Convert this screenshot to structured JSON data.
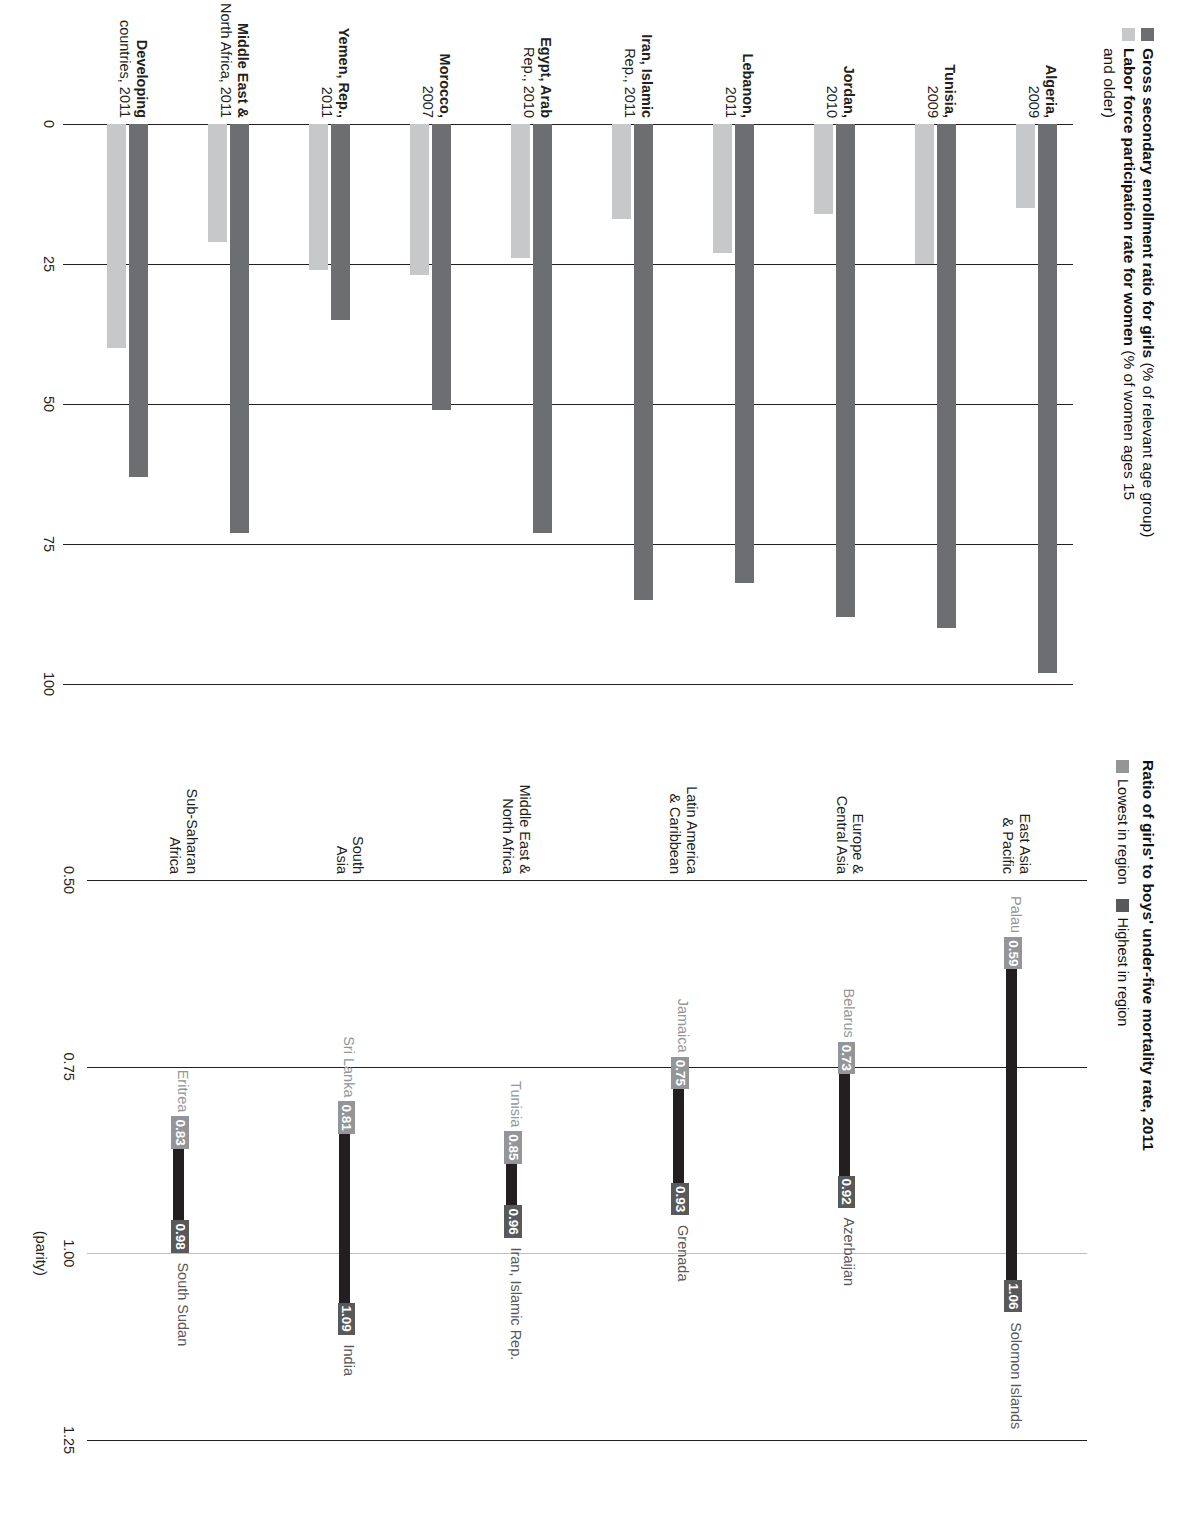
{
  "charts": {
    "enrollment": {
      "title_bold_1": "Gross secondary enrollment ratio for girls",
      "title_reg_1": " (% of relevant age group)",
      "title_bold_2": "Labor force participation rate for women",
      "title_reg_2": " (% of women ages 15",
      "title_reg_2b": "and older)",
      "legend": [
        {
          "label": "Gross secondary enrollment ratio for girls",
          "color": "#6d6e71"
        },
        {
          "label": "Labor force participation rate for women",
          "color": "#c7c8ca"
        }
      ],
      "yticks": [
        "100",
        "75",
        "50",
        "25",
        "0"
      ],
      "categories": [
        {
          "name": "Algeria,",
          "year": "2009"
        },
        {
          "name": "Tunisia,",
          "year": "2009"
        },
        {
          "name": "Jordan,",
          "year": "2010"
        },
        {
          "name": "Lebanon,",
          "year": "2011"
        },
        {
          "name": "Iran, Islamic",
          "year": "Rep., 2011"
        },
        {
          "name": "Egypt, Arab",
          "year": "Rep., 2010"
        },
        {
          "name": "Morocco,",
          "year": "2007"
        },
        {
          "name": "Yemen, Rep.,",
          "year": "2011"
        },
        {
          "name": "Middle East &",
          "year": "North Africa, 2011"
        },
        {
          "name": "Developing",
          "year": "countries, 2011"
        }
      ],
      "series": [
        {
          "name": "Gross secondary enrollment ratio for girls",
          "values": [
            98,
            90,
            88,
            82,
            85,
            73,
            51,
            35,
            73,
            63
          ]
        },
        {
          "name": "Labor force participation rate for women",
          "values": [
            15,
            25,
            16,
            23,
            17,
            24,
            27,
            26,
            21,
            40
          ]
        }
      ]
    },
    "mortality": {
      "title": "Ratio of girls' to boys' under-five mortality rate, 2011",
      "legend": [
        {
          "label": "Lowest in region",
          "color": "#939598"
        },
        {
          "label": "Highest in region",
          "color": "#58595b"
        }
      ],
      "xticks": [
        "0.50",
        "0.75",
        "1.00",
        "1.25"
      ],
      "parity_label": "(parity)",
      "rows": [
        {
          "region": "East Asia\n& Pacific",
          "low_country": "Palau",
          "low": "0.59",
          "high_country": "Solomon Islands",
          "high": "1.06"
        },
        {
          "region": "Europe &\nCentral Asia",
          "low_country": "Belarus",
          "low": "0.73",
          "high_country": "Azerbaijan",
          "high": "0.92"
        },
        {
          "region": "Latin America\n& Caribbean",
          "low_country": "Jamaica",
          "low": "0.75",
          "high_country": "Grenada",
          "high": "0.93"
        },
        {
          "region": "Middle East &\nNorth Africa",
          "low_country": "Tunisia",
          "low": "0.85",
          "high_country": "Iran, Islamic Rep.",
          "high": "0.96"
        },
        {
          "region": "South\nAsia",
          "low_country": "Sri Lanka",
          "low": "0.81",
          "high_country": "India",
          "high": "1.09"
        },
        {
          "region": "Sub-Saharan\nAfrica",
          "low_country": "Eritrea",
          "low": "0.83",
          "high_country": "South Sudan",
          "high": "0.98"
        }
      ]
    },
    "co2": {
      "title_bold": "Carbon dioxide emissions",
      "title_reg": " (metric tons per capita)",
      "yticks": [
        "30",
        "20",
        "10",
        "0"
      ],
      "series_labels": [
        "1990",
        "2009"
      ],
      "categories": [
        "Luxembourg",
        "Faeroe Islands",
        "Kazakhstan",
        "Estonia",
        "Russian Federation",
        "Czech Republic",
        "Netherlands",
        "Greenland",
        "Finland",
        "Norway",
        "Europe & Central Asia"
      ],
      "series": [
        {
          "name": "1990",
          "values": [
            25.6,
            13.2,
            15.4,
            13.6,
            14.9,
            14.4,
            10.6,
            10.0,
            10.4,
            7.5,
            9.9
          ]
        },
        {
          "name": "2009",
          "values": [
            21.0,
            13.0,
            14.3,
            13.4,
            11.8,
            10.8,
            10.3,
            10.1,
            10.1,
            10.1,
            7.2
          ]
        }
      ]
    },
    "energy": {
      "title_bold": "Energy use, 2010",
      "title_reg": " (%)",
      "yticks": [
        "100",
        "75",
        "50",
        "25",
        "0"
      ],
      "legend": [
        {
          "label": "Alternative and nuclear energy",
          "color": "#d4d5d7"
        },
        {
          "label": "Combustible renewables and waste",
          "color": "#1a1a1a"
        },
        {
          "label": "Fossil fuel",
          "color": "#808285"
        }
      ],
      "categories": [
        "Latin\nAmerica &\nCaribbean",
        "Europe\n& Central\nAsia",
        "East Asia\n& Pacific",
        "South\nAsia",
        "Sub-Saharan\nAfrica",
        "Middle East\n& North\nAfrica"
      ],
      "series": [
        {
          "name": "Fossil fuel",
          "values": [
            72,
            87,
            81,
            73,
            31,
            98
          ]
        },
        {
          "name": "Combustible renewables and waste",
          "values": [
            14,
            2,
            9,
            25,
            60,
            1
          ]
        },
        {
          "name": "Alternative and nuclear energy",
          "values": [
            14,
            11,
            10,
            2,
            9,
            1
          ]
        }
      ]
    }
  },
  "chart_data": [
    {
      "type": "bar",
      "title": "Gross secondary enrollment ratio for girls (% of relevant age group) / Labor force participation rate for women (% of women ages 15 and older)",
      "orientation": "horizontal",
      "categories": [
        "Algeria, 2009",
        "Tunisia, 2009",
        "Jordan, 2010",
        "Lebanon, 2011",
        "Iran, Islamic Rep., 2011",
        "Egypt, Arab Rep., 2010",
        "Morocco, 2007",
        "Yemen, Rep., 2011",
        "Middle East & North Africa, 2011",
        "Developing countries, 2011"
      ],
      "series": [
        {
          "name": "Gross secondary enrollment ratio for girls",
          "values": [
            98,
            90,
            88,
            82,
            85,
            73,
            51,
            35,
            73,
            63
          ]
        },
        {
          "name": "Labor force participation rate for women",
          "values": [
            15,
            25,
            16,
            23,
            17,
            24,
            27,
            26,
            21,
            40
          ]
        }
      ],
      "xlabel": "",
      "ylabel": "%",
      "ylim": [
        0,
        100
      ],
      "ticks": [
        0,
        25,
        50,
        75,
        100
      ],
      "grid": true,
      "legend": "top"
    },
    {
      "type": "bar",
      "title": "Ratio of girls' to boys' under-five mortality rate, 2011",
      "orientation": "horizontal-range",
      "categories": [
        "East Asia & Pacific",
        "Europe & Central Asia",
        "Latin America & Caribbean",
        "Middle East & North Africa",
        "South Asia",
        "Sub-Saharan Africa"
      ],
      "series": [
        {
          "name": "Lowest in region",
          "values": [
            0.59,
            0.73,
            0.75,
            0.85,
            0.81,
            0.83
          ],
          "labels": [
            "Palau",
            "Belarus",
            "Jamaica",
            "Tunisia",
            "Sri Lanka",
            "Eritrea"
          ]
        },
        {
          "name": "Highest in region",
          "values": [
            1.06,
            0.92,
            0.93,
            0.96,
            1.09,
            0.98
          ],
          "labels": [
            "Solomon Islands",
            "Azerbaijan",
            "Grenada",
            "Iran, Islamic Rep.",
            "India",
            "South Sudan"
          ]
        }
      ],
      "xlabel": "(parity)",
      "ylabel": "",
      "xlim": [
        0.5,
        1.25
      ],
      "ticks": [
        0.5,
        0.75,
        1.0,
        1.25
      ],
      "grid": true,
      "legend": "top"
    },
    {
      "type": "bar",
      "title": "Carbon dioxide emissions (metric tons per capita)",
      "orientation": "horizontal",
      "categories": [
        "Luxembourg",
        "Faeroe Islands",
        "Kazakhstan",
        "Estonia",
        "Russian Federation",
        "Czech Republic",
        "Netherlands",
        "Greenland",
        "Finland",
        "Norway",
        "Europe & Central Asia"
      ],
      "series": [
        {
          "name": "1990",
          "values": [
            25.6,
            13.2,
            15.4,
            13.6,
            14.9,
            14.4,
            10.6,
            10.0,
            10.4,
            7.5,
            9.9
          ]
        },
        {
          "name": "2009",
          "values": [
            21.0,
            13.0,
            14.3,
            13.4,
            11.8,
            10.8,
            10.3,
            10.1,
            10.1,
            10.1,
            7.2
          ]
        }
      ],
      "xlabel": "",
      "ylabel": "metric tons per capita",
      "ylim": [
        0,
        30
      ],
      "ticks": [
        0,
        10,
        20,
        30
      ],
      "grid": true,
      "legend": "inline"
    },
    {
      "type": "bar",
      "title": "Energy use, 2010 (%)",
      "orientation": "vertical-stacked",
      "categories": [
        "Latin America & Caribbean",
        "Europe & Central Asia",
        "East Asia & Pacific",
        "South Asia",
        "Sub-Saharan Africa",
        "Middle East & North Africa"
      ],
      "series": [
        {
          "name": "Fossil fuel",
          "values": [
            72,
            87,
            81,
            73,
            31,
            98
          ]
        },
        {
          "name": "Combustible renewables and waste",
          "values": [
            14,
            2,
            9,
            25,
            60,
            1
          ]
        },
        {
          "name": "Alternative and nuclear energy",
          "values": [
            14,
            11,
            10,
            2,
            9,
            1
          ]
        }
      ],
      "xlabel": "",
      "ylabel": "%",
      "ylim": [
        0,
        100
      ],
      "ticks": [
        0,
        25,
        50,
        75,
        100
      ],
      "grid": true,
      "legend": "inside-bottom"
    }
  ]
}
